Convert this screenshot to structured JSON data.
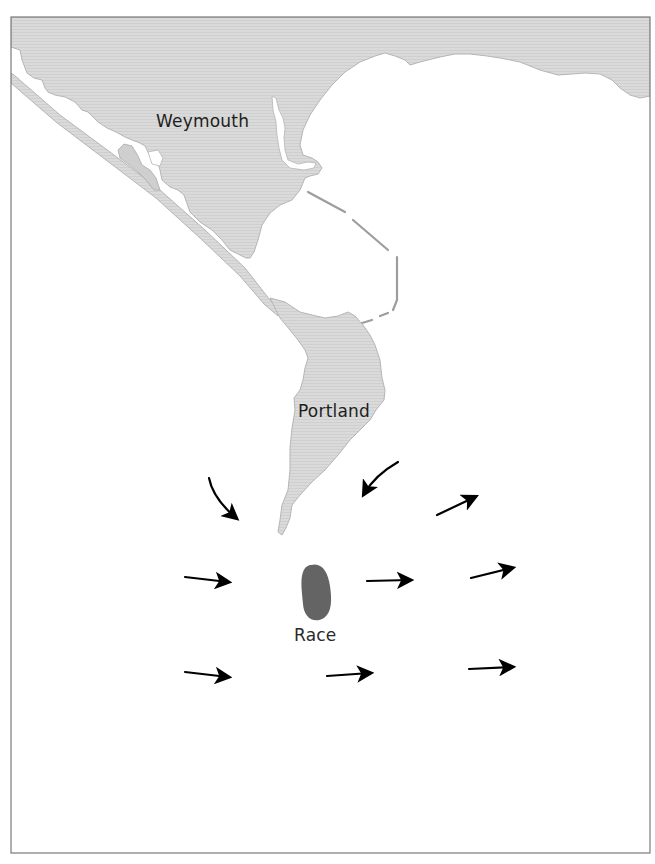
{
  "map": {
    "frame": {
      "x": 11,
      "y": 17,
      "width": 639,
      "height": 836
    },
    "colors": {
      "land": "#d9d9d9",
      "land_stroke": "#b3b3b3",
      "sea": "#ffffff",
      "race": "#646464",
      "arrow": "#000000",
      "frame": "#7a7a7a",
      "text": "#1e1e1e"
    },
    "labels": {
      "weymouth": {
        "text": "Weymouth",
        "x": 156,
        "y": 111
      },
      "portland": {
        "text": "Portland",
        "x": 298,
        "y": 401
      },
      "race": {
        "text": "Race",
        "x": 294,
        "y": 625
      }
    },
    "race_area": {
      "name": "Race",
      "cx": 316,
      "cy": 593
    },
    "arrows": [
      {
        "id": "nw-curved",
        "direction": "south-east",
        "curved": true
      },
      {
        "id": "ne-curved",
        "direction": "south-west",
        "curved": true
      },
      {
        "id": "upper-right",
        "direction": "north-east",
        "curved": false
      },
      {
        "id": "mid-left",
        "direction": "east",
        "curved": false
      },
      {
        "id": "mid-center",
        "direction": "east",
        "curved": false
      },
      {
        "id": "mid-right",
        "direction": "east-north-east",
        "curved": false
      },
      {
        "id": "low-left",
        "direction": "east",
        "curved": false
      },
      {
        "id": "low-center",
        "direction": "east",
        "curved": false
      },
      {
        "id": "low-right",
        "direction": "east",
        "curved": false
      }
    ]
  }
}
